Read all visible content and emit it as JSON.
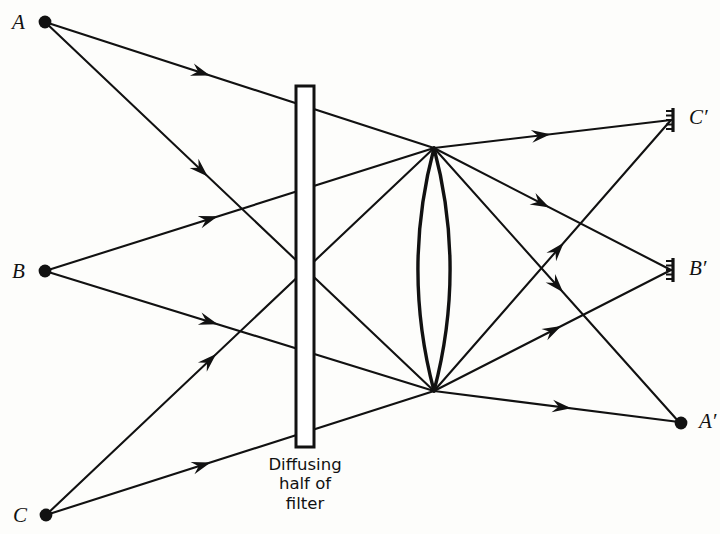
{
  "figure": {
    "background_color": "#fdfdfb",
    "ink_color": "#111111"
  },
  "objects": [
    {
      "id": "A",
      "label": "A",
      "x": 45,
      "y": 22,
      "label_x": 12,
      "label_y": 12,
      "marker": "dot"
    },
    {
      "id": "B",
      "label": "B",
      "x": 45,
      "y": 271,
      "label_x": 12,
      "label_y": 261,
      "marker": "dot"
    },
    {
      "id": "C",
      "label": "C",
      "x": 46,
      "y": 515,
      "label_x": 13,
      "label_y": 505,
      "marker": "dot"
    }
  ],
  "images": [
    {
      "id": "Cp",
      "label": "C′",
      "x": 673,
      "y": 120,
      "label_x": 689,
      "label_y": 107,
      "marker": "screen"
    },
    {
      "id": "Bp",
      "label": "B′",
      "x": 673,
      "y": 270,
      "label_x": 689,
      "label_y": 258,
      "marker": "screen"
    },
    {
      "id": "Ap",
      "label": "A′",
      "x": 681,
      "y": 423,
      "label_x": 699,
      "label_y": 411,
      "marker": "dot"
    }
  ],
  "filter": {
    "x_left": 296,
    "x_right": 314,
    "y_top": 86,
    "y_bottom": 447,
    "diffusing_y_start": 264,
    "caption_lines": [
      "Diffusing",
      "half of",
      "filter"
    ],
    "caption_x": 305,
    "caption_y": 455
  },
  "lens": {
    "center_x": 434,
    "top_vertex_y": 148,
    "bottom_vertex_y": 391,
    "half_width": 24,
    "type": "biconvex"
  },
  "chart_data": {
    "type": "diagram",
    "title": "Diffusing half of filter",
    "rays": [
      {
        "from": "A",
        "to": "lens_top",
        "x1": 45,
        "y1": 22,
        "x2": 434,
        "y2": 148,
        "arrow_t": 0.4
      },
      {
        "from": "A",
        "to": "lens_bottom",
        "x1": 45,
        "y1": 22,
        "x2": 434,
        "y2": 391,
        "arrow_t": 0.4
      },
      {
        "from": "B",
        "to": "lens_top",
        "x1": 45,
        "y1": 271,
        "x2": 434,
        "y2": 148,
        "arrow_t": 0.42
      },
      {
        "from": "B",
        "to": "lens_bottom",
        "x1": 45,
        "y1": 271,
        "x2": 434,
        "y2": 391,
        "arrow_t": 0.42
      },
      {
        "from": "C",
        "to": "lens_top",
        "x1": 46,
        "y1": 515,
        "x2": 434,
        "y2": 148,
        "arrow_t": 0.42
      },
      {
        "from": "C",
        "to": "lens_bottom",
        "x1": 46,
        "y1": 515,
        "x2": 434,
        "y2": 391,
        "arrow_t": 0.4
      },
      {
        "from": "lens_top",
        "to": "Cp",
        "x1": 434,
        "y1": 148,
        "x2": 671,
        "y2": 120,
        "arrow_t": 0.45
      },
      {
        "from": "lens_bottom",
        "to": "Cp",
        "x1": 434,
        "y1": 391,
        "x2": 671,
        "y2": 120,
        "arrow_t": 0.52
      },
      {
        "from": "lens_top",
        "to": "Bp",
        "x1": 434,
        "y1": 148,
        "x2": 671,
        "y2": 270,
        "arrow_t": 0.45
      },
      {
        "from": "lens_bottom",
        "to": "Bp",
        "x1": 434,
        "y1": 391,
        "x2": 671,
        "y2": 270,
        "arrow_t": 0.5
      },
      {
        "from": "lens_top",
        "to": "Ap",
        "x1": 434,
        "y1": 148,
        "x2": 679,
        "y2": 422,
        "arrow_t": 0.5
      },
      {
        "from": "lens_bottom",
        "to": "Ap",
        "x1": 434,
        "y1": 391,
        "x2": 679,
        "y2": 422,
        "arrow_t": 0.52
      }
    ]
  }
}
